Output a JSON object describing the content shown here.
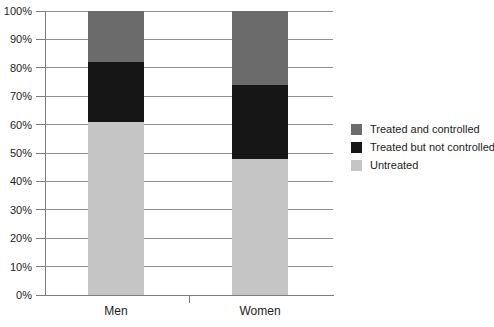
{
  "chart_data": {
    "type": "bar",
    "subtype": "stacked-percentage-bar",
    "title": "",
    "categories": [
      "Men",
      "Women"
    ],
    "series": [
      {
        "name": "Untreated",
        "values": [
          61,
          48
        ],
        "color": "#c5c5c5"
      },
      {
        "name": "Treated but not controlled",
        "values": [
          21,
          26
        ],
        "color": "#161616"
      },
      {
        "name": "Treated and controlled",
        "values": [
          18,
          26
        ],
        "color": "#6b6b6b"
      }
    ],
    "legend": {
      "position": "right",
      "entries": [
        "Treated and controlled",
        "Treated but not controlled",
        "Untreated"
      ]
    },
    "ylim": [
      0,
      100
    ],
    "ytick_step": 10,
    "ytick_suffix": "%",
    "ytick_labels": [
      "0%",
      "10%",
      "20%",
      "30%",
      "40%",
      "50%",
      "60%",
      "70%",
      "80%",
      "90%",
      "100%"
    ],
    "grid": true
  },
  "colors": {
    "background": "#ffffff",
    "gridline": "#8f8f8f",
    "axis": "#7d7d7d",
    "text": "#1c1c1c"
  }
}
